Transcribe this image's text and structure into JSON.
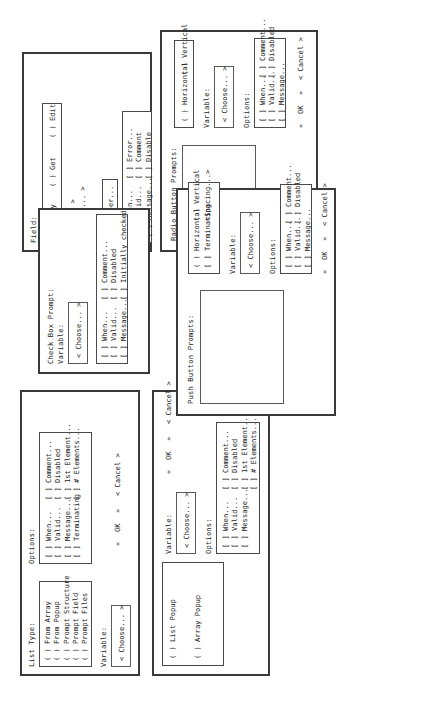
{
  "page": {
    "orientation": "rotated-90-ccw"
  },
  "dialogs": [
    {
      "id": "list-dialog",
      "name": "List Dialog",
      "labels": {
        "list_type": "List Type:",
        "options": "Options:",
        "variable": "Variable:"
      },
      "list_type_radios": [
        "( ) From Array",
        "( ) From Popup",
        "( ) Prompt Structure",
        "( ) Prompt Field",
        "( ) Prompt Files"
      ],
      "options_col1": [
        "[ ] When...",
        "[ ] Valid...",
        "[ ] Message...",
        "[ ] Terminating"
      ],
      "options_col2": [
        "[ ] Comment...",
        "[ ] Disabled",
        "[ ] 1st Element...",
        "[ ] # Elements..."
      ],
      "variable_button": "< Choose... >",
      "buttons": {
        "ok": "OK",
        "cancel": "< Cancel >",
        "left_mark": "«",
        "right_mark": "»"
      }
    },
    {
      "id": "popup-dialog",
      "name": "Popup Dialog",
      "type_radios": [
        "( ) List Popup",
        "( ) Array Popup"
      ],
      "labels": {
        "variable": "Variable:",
        "options": "Options:"
      },
      "variable_button": "< Choose... >",
      "options_col1": [
        "[ ] When...",
        "[ ] Valid...",
        "[ ] Message..."
      ],
      "options_col2": [
        "[ ] Comment...",
        "[ ] Disabled",
        "[ ] 1st Element...",
        "[ ] # Elements..."
      ],
      "buttons": {
        "ok": "OK",
        "cancel": "< Cancel >",
        "left_mark": "«",
        "right_mark": "»"
      }
    },
    {
      "id": "field-dialog",
      "name": "Field Dialog",
      "labels": {
        "field": "Field:",
        "range": "Range:"
      },
      "mode_radios": [
        "( ) Say",
        "( ) Get",
        "( ) Edit"
      ],
      "range_buttons": [
        "< Get... >",
        "< Format... >"
      ],
      "upper_option": "[ ] Upper...",
      "options_col1": [
        "[ ] When...",
        "[ ] Valid...",
        "[ ] Message..."
      ],
      "options_col2": [
        "[ ] Error...",
        "[ ] Comment",
        "[ ] Disable"
      ]
    },
    {
      "id": "checkbox-dialog",
      "name": "Check Box Prompt Dialog",
      "labels": {
        "title": "Check Box Prompt:",
        "variable": "Variable:"
      },
      "variable_button": "< Choose... >",
      "options_col1": [
        "[ ] When...",
        "[ ] Valid...",
        "[ ] Message..."
      ],
      "options_col2": [
        "[ ] Comment...",
        "[ ] Disabled",
        "[ ] Initially checked"
      ]
    },
    {
      "id": "radio-dialog",
      "name": "Radio Button Prompts Dialog",
      "labels": {
        "title": "Radio Button Prompts:",
        "variable": "Variable:",
        "options": "Options:",
        "initial": "Initial:"
      },
      "orientation_radios": [
        "( ) Horizontal",
        "( ) Vertical"
      ],
      "variable_button": "< Choose... >",
      "options_col1": [
        "[ ] When...",
        "[ ] Valid...",
        "[ ] Message..."
      ],
      "options_col2": [
        "[ ] Comment...",
        "[ ] Disabled"
      ],
      "buttons": {
        "ok": "OK",
        "cancel": "< Cancel >",
        "left_mark": "«",
        "right_mark": "»"
      }
    },
    {
      "id": "pushbutton-dialog",
      "name": "Push Button Prompts Dialog",
      "labels": {
        "title": "Push Button Prompts:",
        "variable": "Variable:",
        "options": "Options:"
      },
      "orientation_radios": [
        "( ) Horizontal",
        "( ) Vertical"
      ],
      "terminating_row": [
        "[ ] Terminating",
        "<Spacing...>"
      ],
      "variable_button": "< Choose... >",
      "options_col1": [
        "[ ] When...",
        "[ ] Valid...",
        "[ ] Message..."
      ],
      "options_col2": [
        "[ ] Comment...",
        "[ ] Disabled"
      ],
      "buttons": {
        "ok": "OK",
        "cancel": "< Cancel >",
        "left_mark": "«",
        "right_mark": "»"
      }
    }
  ]
}
